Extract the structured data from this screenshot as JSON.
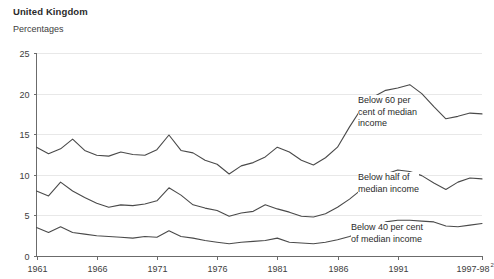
{
  "header": {
    "region_title": "United Kingdom",
    "units_label": "Percentages"
  },
  "chart_data": {
    "type": "line",
    "title": "United Kingdom",
    "subtitle": "Percentages",
    "xlabel": "",
    "ylabel": "Percentages",
    "ylim": [
      0,
      25
    ],
    "yticks": [
      0,
      5,
      10,
      15,
      20,
      25
    ],
    "ytick_labels": [
      "0",
      "5",
      "10",
      "15",
      "20",
      "25"
    ],
    "xlim": [
      1961,
      1998
    ],
    "xticks": [
      1961,
      1966,
      1971,
      1976,
      1981,
      1986,
      1991,
      1998
    ],
    "xtick_labels": [
      "1961",
      "1966",
      "1971",
      "1976",
      "1981",
      "1986",
      "1991",
      "1997-98"
    ],
    "xtick_last_superscript": "2",
    "grid": true,
    "grid_axis": "y",
    "legend": "annotations-inline",
    "line_color": "#4a4a4a",
    "x": [
      1961,
      1962,
      1963,
      1964,
      1965,
      1966,
      1967,
      1968,
      1969,
      1970,
      1971,
      1972,
      1973,
      1974,
      1975,
      1976,
      1977,
      1978,
      1979,
      1980,
      1981,
      1982,
      1983,
      1984,
      1985,
      1986,
      1987,
      1988,
      1989,
      1990,
      1991,
      1992,
      1993,
      1994,
      1995,
      1996,
      1997,
      1998
    ],
    "series": [
      {
        "name": "Below 60 per cent of median income",
        "annotation": "Below 60 per\ncent of median\nincome",
        "values": [
          13.4,
          12.6,
          13.2,
          14.4,
          13.0,
          12.4,
          12.3,
          12.8,
          12.5,
          12.4,
          13.1,
          14.9,
          13.0,
          12.7,
          11.8,
          11.3,
          10.1,
          11.1,
          11.5,
          12.2,
          13.4,
          12.8,
          11.8,
          11.2,
          12.1,
          13.4,
          15.9,
          18.2,
          19.6,
          20.4,
          20.7,
          21.1,
          20.0,
          18.4,
          16.9,
          17.2,
          17.6,
          17.5
        ]
      },
      {
        "name": "Below half of median income",
        "annotation": "Below half of\nmedian income",
        "values": [
          8.0,
          7.4,
          9.1,
          8.0,
          7.2,
          6.5,
          6.0,
          6.3,
          6.2,
          6.4,
          6.8,
          8.4,
          7.5,
          6.3,
          5.9,
          5.6,
          4.9,
          5.3,
          5.5,
          6.3,
          5.8,
          5.4,
          4.9,
          4.8,
          5.2,
          6.0,
          7.0,
          8.2,
          9.4,
          10.1,
          10.6,
          10.4,
          9.9,
          9.0,
          8.2,
          9.1,
          9.6,
          9.5
        ]
      },
      {
        "name": "Below 40 per cent of median income",
        "annotation": "Below 40 per cent\nof median income",
        "values": [
          3.5,
          2.9,
          3.6,
          2.9,
          2.7,
          2.5,
          2.4,
          2.3,
          2.2,
          2.4,
          2.3,
          3.1,
          2.4,
          2.2,
          1.9,
          1.7,
          1.5,
          1.7,
          1.8,
          1.9,
          2.2,
          1.7,
          1.6,
          1.5,
          1.7,
          2.0,
          2.4,
          3.0,
          3.6,
          4.2,
          4.4,
          4.4,
          4.3,
          4.2,
          3.7,
          3.6,
          3.8,
          4.0
        ]
      }
    ]
  }
}
